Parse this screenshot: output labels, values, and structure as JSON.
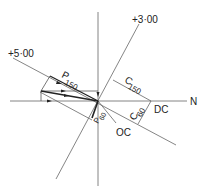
{
  "diagram": {
    "type": "vector-diagram",
    "axes": {
      "horizontal_label": "N"
    },
    "labels": {
      "meridian_plus5": "+5·00",
      "meridian_plus3": "+3·00",
      "p150_main": "P",
      "p150_sub": "150",
      "c150_main": "C",
      "c150_sub": "150",
      "c60_main": "C",
      "c60_sub": "60",
      "p60_main": "P",
      "p60_sub": "60",
      "dc": "DC",
      "oc": "OC",
      "n": "N"
    },
    "colors": {
      "line": "#555555",
      "vector": "#333333",
      "text": "#222222"
    }
  }
}
